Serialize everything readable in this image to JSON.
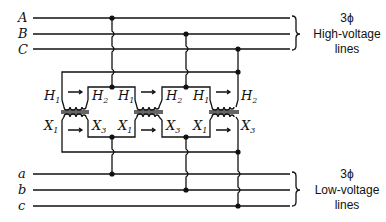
{
  "diagram": {
    "high_voltage_lines": [
      "A",
      "B",
      "C"
    ],
    "low_voltage_lines": [
      "a",
      "b",
      "c"
    ],
    "high_group_label": {
      "phase": "3ϕ",
      "line1": "High-voltage",
      "line2": "lines"
    },
    "low_group_label": {
      "phase": "3ϕ",
      "line1": "Low-voltage",
      "line2": "lines"
    },
    "transformers": [
      {
        "primary_left": "H",
        "primary_left_sub": "1",
        "primary_right": "H",
        "primary_right_sub": "2",
        "secondary_left": "X",
        "secondary_left_sub": "1",
        "secondary_right": "X",
        "secondary_right_sub": "3"
      },
      {
        "primary_left": "H",
        "primary_left_sub": "1",
        "primary_right": "H",
        "primary_right_sub": "2",
        "secondary_left": "X",
        "secondary_left_sub": "1",
        "secondary_right": "X",
        "secondary_right_sub": "3"
      },
      {
        "primary_left": "H",
        "primary_left_sub": "1",
        "primary_right": "H",
        "primary_right_sub": "2",
        "secondary_left": "X",
        "secondary_left_sub": "1",
        "secondary_right": "X",
        "secondary_right_sub": "3"
      }
    ]
  }
}
